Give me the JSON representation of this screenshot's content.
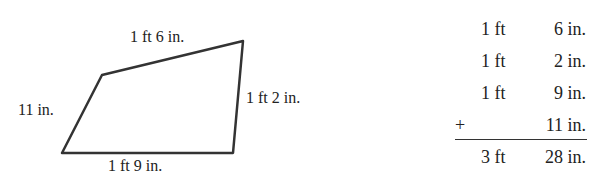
{
  "figure": {
    "vertices": [
      [
        102,
        75
      ],
      [
        243,
        41
      ],
      [
        233,
        153
      ],
      [
        62,
        153
      ]
    ],
    "side_labels": {
      "top": "1 ft 6 in.",
      "right": "1 ft 2 in.",
      "bottom": "1 ft 9 in.",
      "left": "11 in."
    }
  },
  "addition": {
    "rows": [
      {
        "ft": "1 ft",
        "in": "6 in."
      },
      {
        "ft": "1 ft",
        "in": "2 in."
      },
      {
        "ft": "1 ft",
        "in": "9 in."
      },
      {
        "op": "+",
        "ft": "",
        "in": "11 in."
      }
    ],
    "total": {
      "ft": "3 ft",
      "in": "28 in."
    }
  }
}
